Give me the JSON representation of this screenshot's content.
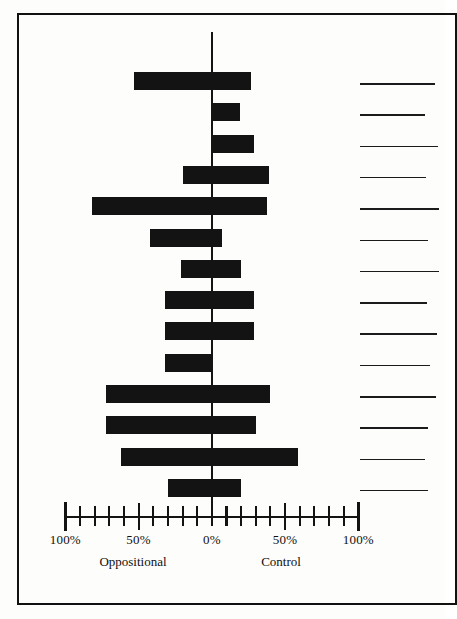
{
  "figure": {
    "frame": true,
    "background_color": "#fdfdfb",
    "ink_color": "#131313"
  },
  "chart_data": {
    "type": "bar",
    "orientation": "horizontal-diverging",
    "title": "",
    "subtitle": "",
    "xlabel": "",
    "ylabel": "",
    "grid": false,
    "legend": "none",
    "axis": {
      "tick_labels": [
        "100%",
        "50%",
        "0%",
        "50%",
        "100%"
      ],
      "tick_values": [
        -100,
        -50,
        0,
        50,
        100
      ],
      "minor_tick_step": 10,
      "xlim": [
        -100,
        100
      ],
      "zero_at": "0%"
    },
    "group_labels": {
      "left": "Oppositional",
      "right": "Control"
    },
    "categories": [
      "",
      "",
      "",
      "",
      "",
      "",
      "",
      "",
      "",
      "",
      "",
      "",
      "",
      ""
    ],
    "category_labels_redacted": true,
    "series": [
      {
        "name": "Oppositional",
        "side": "left",
        "values": [
          53,
          0,
          0,
          20,
          82,
          42,
          21,
          32,
          32,
          32,
          72,
          72,
          62,
          30
        ]
      },
      {
        "name": "Control",
        "side": "right",
        "values": [
          27,
          19,
          29,
          39,
          38,
          7,
          20,
          29,
          29,
          0,
          40,
          30,
          59,
          20
        ]
      }
    ],
    "annotations": []
  },
  "category_rule_lengths": [
    75,
    65,
    78,
    66,
    79,
    68,
    79,
    67,
    77,
    70,
    76,
    68,
    65,
    68
  ]
}
